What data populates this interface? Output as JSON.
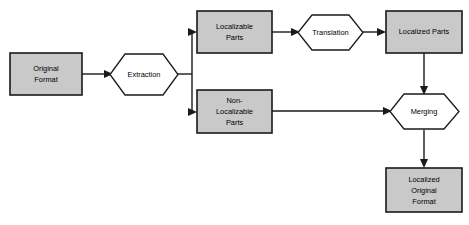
{
  "diagram": {
    "colors": {
      "box_fill": "#c9c9c9",
      "hex_fill": "#ffffff",
      "stroke": "#1a1a1a",
      "background": "#ffffff",
      "text": "#000000"
    },
    "nodes": [
      {
        "id": "original-format",
        "shape": "rectangle",
        "label": "Original\nFormat",
        "line1": "Original",
        "line2": "Format",
        "line3": ""
      },
      {
        "id": "extraction",
        "shape": "hexagon",
        "label": "Extraction",
        "line1": "Extraction",
        "line2": "",
        "line3": ""
      },
      {
        "id": "localizable-parts",
        "shape": "rectangle",
        "label": "Localizable\nParts",
        "line1": "Localizable",
        "line2": "Parts",
        "line3": ""
      },
      {
        "id": "translation",
        "shape": "hexagon",
        "label": "Translation",
        "line1": "Translation",
        "line2": "",
        "line3": ""
      },
      {
        "id": "localized-parts",
        "shape": "rectangle",
        "label": "Localized Parts",
        "line1": "Localized Parts",
        "line2": "",
        "line3": ""
      },
      {
        "id": "non-localizable-parts",
        "shape": "rectangle",
        "label": "Non-\nLocalizable\nParts",
        "line1": "Non-",
        "line2": "Localizable",
        "line3": "Parts"
      },
      {
        "id": "merging",
        "shape": "hexagon",
        "label": "Merging",
        "line1": "Merging",
        "line2": "",
        "line3": ""
      },
      {
        "id": "localized-original-format",
        "shape": "rectangle",
        "label": "Localized\nOriginal\nFormat",
        "line1": "Localized",
        "line2": "Original",
        "line3": "Format"
      }
    ],
    "edges": [
      {
        "id": "edge-original-to-extraction",
        "from": "original-format",
        "to": "extraction"
      },
      {
        "id": "edge-extraction-to-localizable",
        "from": "extraction",
        "to": "localizable-parts"
      },
      {
        "id": "edge-extraction-to-nonlocalizable",
        "from": "extraction",
        "to": "non-localizable-parts"
      },
      {
        "id": "edge-localizable-to-translation",
        "from": "localizable-parts",
        "to": "translation"
      },
      {
        "id": "edge-translation-to-localized",
        "from": "translation",
        "to": "localized-parts"
      },
      {
        "id": "edge-localized-to-merging",
        "from": "localized-parts",
        "to": "merging"
      },
      {
        "id": "edge-nonlocalizable-to-merging",
        "from": "non-localizable-parts",
        "to": "merging"
      },
      {
        "id": "edge-merging-to-output",
        "from": "merging",
        "to": "localized-original-format"
      }
    ]
  }
}
